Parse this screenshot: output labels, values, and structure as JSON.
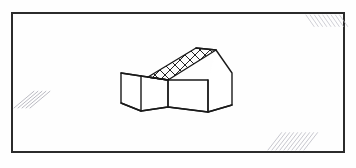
{
  "document": {
    "title": "Axonometric sketch of a gable-roofed house with side wing",
    "medium": "scanned ink line drawing",
    "background_color": "#fefefe",
    "ink_color": "#1a1a1a",
    "canvas": {
      "width": 356,
      "height": 168
    }
  },
  "frame": {
    "name": "border-rectangle",
    "stroke_color": "#2b2b2b",
    "stroke_width": 2,
    "x": 12,
    "y": 13,
    "width": 332,
    "height": 139,
    "corners": [
      {
        "position": "top-left",
        "x": 12,
        "y": 13
      },
      {
        "position": "top-right",
        "x": 344,
        "y": 13
      },
      {
        "position": "bottom-right",
        "x": 344,
        "y": 152
      },
      {
        "position": "bottom-left",
        "x": 12,
        "y": 152
      }
    ]
  },
  "corner_hatches": [
    {
      "name": "top-right-hatch",
      "position": "top-right",
      "stroke_color": "#b9b9c2",
      "stroke_width": 0.9,
      "opacity": 0.75,
      "stroke_count": 9,
      "angle_deg": 55,
      "origin_x": 306,
      "origin_y": 15,
      "length": 14,
      "spacing": 4.2
    },
    {
      "name": "bottom-left-hatch",
      "position": "bottom-left",
      "stroke_color": "#9f9faa",
      "stroke_width": 1.0,
      "opacity": 0.7,
      "stroke_count": 5,
      "angle_deg": 40,
      "origin_x": 14,
      "origin_y": 108,
      "length": 26,
      "spacing": 4.0
    },
    {
      "name": "bottom-right-hatch",
      "position": "bottom-right",
      "stroke_color": "#b2b2bc",
      "stroke_width": 1.0,
      "opacity": 0.72,
      "stroke_count": 10,
      "angle_deg": 52,
      "origin_x": 268,
      "origin_y": 150,
      "length": 22,
      "spacing": 4.0
    }
  ],
  "house": {
    "name": "house-axonometric",
    "description": "Two-mass dwelling drawn in axonometric projection: a tall gabled main volume on the right with a cross-hatched pitched roof plane, and a lower flat-topped wing attached on the left.",
    "stroke_color": "#1a1a1a",
    "stroke_width": 1.4,
    "parts": [
      {
        "name": "roof-plane",
        "label": "Cross-hatched pitched roof",
        "fill_pattern": "diamond-lattice",
        "pattern_spacing": 5,
        "pattern_angle_deg": 45,
        "pattern_stroke_color": "#1a1a1a",
        "pattern_stroke_width": 0.8,
        "points": "148,77 196,48 216,50 168,80"
      },
      {
        "name": "roof-ridge-line",
        "label": "Roof ridge",
        "points": "196,48 216,50"
      },
      {
        "name": "roof-right-slope",
        "label": "Right roof slope to eave",
        "points": "216,50 232,73"
      },
      {
        "name": "gable-end-wall",
        "label": "Right gable end wall",
        "points": "216,50 232,73 232,105 208,112 208,80"
      },
      {
        "name": "main-front-wall",
        "label": "Main volume front wall",
        "points": "168,80 208,80 208,112 168,107"
      },
      {
        "name": "wing-roof-plane",
        "label": "Lower wing flat top",
        "points": "121,73 148,77 168,80 141,76"
      },
      {
        "name": "wing-front-wall",
        "label": "Lower wing front wall",
        "points": "141,76 168,80 168,107 141,111"
      },
      {
        "name": "wing-left-wall",
        "label": "Lower wing left return wall",
        "points": "121,73 141,76 141,111 121,103"
      },
      {
        "name": "base-ground-line",
        "label": "Base / ground contact line",
        "points": "121,103 141,111 168,107 208,112 232,105"
      }
    ]
  },
  "annotations": {
    "visible_text": [],
    "note": "No labels, legends, dimensions or text appear anywhere in the drawing."
  }
}
